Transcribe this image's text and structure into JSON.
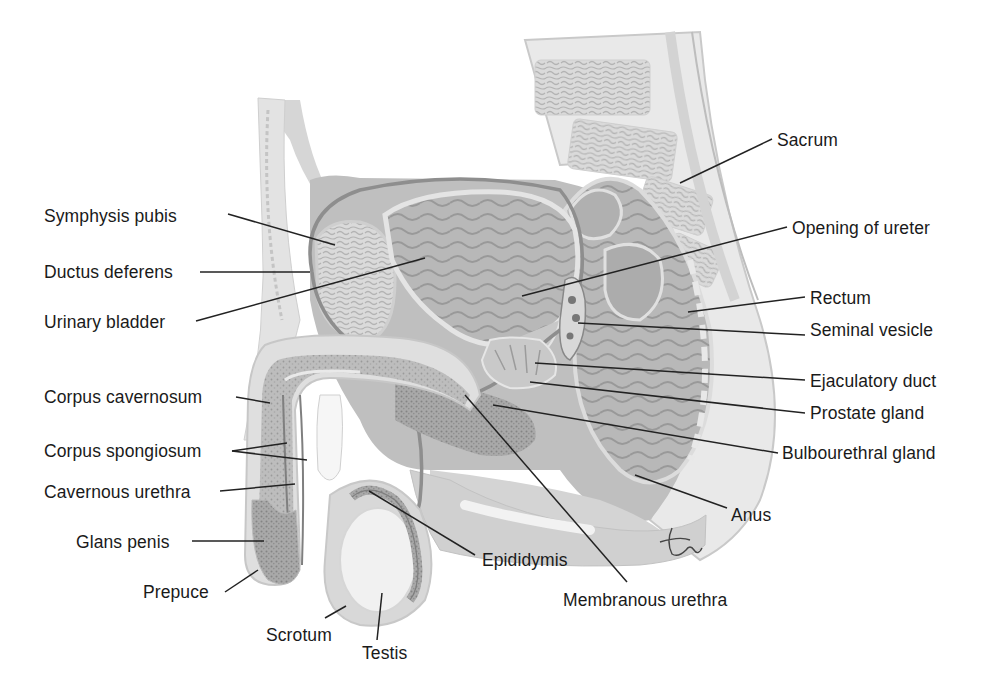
{
  "figure": {
    "signature": "tina",
    "colors": {
      "background": "#ffffff",
      "text": "#1a1a1a",
      "tissue_light": "#e4e4e4",
      "tissue_mid": "#c4c4c4",
      "tissue_dark": "#9a9a9a",
      "leader_line": "#222222"
    }
  },
  "labels": [
    {
      "id": "symphysis-pubis",
      "text": "Symphysis pubis",
      "x": 44,
      "y": 206,
      "side": "left",
      "target": [
        [
          228,
          214
        ],
        [
          335,
          245
        ]
      ]
    },
    {
      "id": "ductus-deferens",
      "text": "Ductus deferens",
      "x": 44,
      "y": 262,
      "side": "left",
      "target": [
        [
          200,
          272
        ],
        [
          310,
          272
        ]
      ]
    },
    {
      "id": "urinary-bladder",
      "text": "Urinary bladder",
      "x": 44,
      "y": 312,
      "side": "left",
      "target": [
        [
          196,
          321
        ],
        [
          425,
          258
        ]
      ]
    },
    {
      "id": "corpus-cavernosum",
      "text": "Corpus cavernosum",
      "x": 44,
      "y": 387,
      "side": "left",
      "target": [
        [
          236,
          397
        ],
        [
          270,
          403
        ]
      ]
    },
    {
      "id": "corpus-spongiosum",
      "text": "Corpus spongiosum",
      "x": 44,
      "y": 441,
      "side": "left",
      "target": [
        [
          232,
          451
        ],
        [
          287,
          443
        ]
      ],
      "target2": [
        [
          232,
          451
        ],
        [
          307,
          460
        ]
      ]
    },
    {
      "id": "cavernous-urethra",
      "text": "Cavernous urethra",
      "x": 44,
      "y": 482,
      "side": "left",
      "target": [
        [
          220,
          491
        ],
        [
          295,
          484
        ]
      ]
    },
    {
      "id": "glans-penis",
      "text": "Glans penis",
      "x": 76,
      "y": 532,
      "side": "left",
      "target": [
        [
          192,
          541
        ],
        [
          264,
          541
        ]
      ]
    },
    {
      "id": "prepuce",
      "text": "Prepuce",
      "x": 143,
      "y": 582,
      "side": "left",
      "target": [
        [
          225,
          592
        ],
        [
          258,
          570
        ]
      ]
    },
    {
      "id": "scrotum",
      "text": "Scrotum",
      "x": 266,
      "y": 625,
      "side": "bottom",
      "target": [
        [
          325,
          618
        ],
        [
          346,
          606
        ]
      ]
    },
    {
      "id": "testis",
      "text": "Testis",
      "x": 362,
      "y": 643,
      "side": "bottom",
      "target": [
        [
          377,
          640
        ],
        [
          382,
          593
        ]
      ]
    },
    {
      "id": "epididymis",
      "text": "Epididymis",
      "x": 482,
      "y": 550,
      "side": "bottom",
      "target": [
        [
          475,
          555
        ],
        [
          369,
          491
        ]
      ]
    },
    {
      "id": "membranous-urethra",
      "text": "Membranous urethra",
      "x": 563,
      "y": 590,
      "side": "bottom",
      "target": [
        [
          627,
          582
        ],
        [
          465,
          395
        ]
      ]
    },
    {
      "id": "sacrum",
      "text": "Sacrum",
      "x": 777,
      "y": 130,
      "side": "right",
      "target": [
        [
          772,
          139
        ],
        [
          680,
          183
        ]
      ]
    },
    {
      "id": "opening-of-ureter",
      "text": "Opening of ureter",
      "x": 792,
      "y": 218,
      "side": "right",
      "target": [
        [
          787,
          227
        ],
        [
          522,
          296
        ]
      ]
    },
    {
      "id": "rectum",
      "text": "Rectum",
      "x": 810,
      "y": 288,
      "side": "right",
      "target": [
        [
          805,
          297
        ],
        [
          688,
          312
        ]
      ]
    },
    {
      "id": "seminal-vesicle",
      "text": "Seminal vesicle",
      "x": 810,
      "y": 320,
      "side": "right",
      "target": [
        [
          805,
          335
        ],
        [
          578,
          323
        ]
      ]
    },
    {
      "id": "ejaculatory-duct",
      "text": "Ejaculatory duct",
      "x": 810,
      "y": 371,
      "side": "right",
      "target": [
        [
          805,
          380
        ],
        [
          535,
          363
        ]
      ]
    },
    {
      "id": "prostate-gland",
      "text": "Prostate gland",
      "x": 810,
      "y": 403,
      "side": "right",
      "target": [
        [
          805,
          413
        ],
        [
          530,
          382
        ]
      ]
    },
    {
      "id": "bulbourethral-gland",
      "text": "Bulbourethral gland",
      "x": 782,
      "y": 443,
      "side": "right",
      "target": [
        [
          778,
          453
        ],
        [
          493,
          405
        ]
      ]
    },
    {
      "id": "anus",
      "text": "Anus",
      "x": 731,
      "y": 505,
      "side": "right",
      "target": [
        [
          727,
          508
        ],
        [
          635,
          475
        ]
      ]
    }
  ]
}
